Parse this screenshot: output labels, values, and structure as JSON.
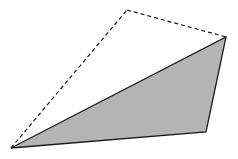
{
  "diagram": {
    "colors": {
      "background": "#ffffff",
      "fill": "#b4b4b4",
      "stroke": "#1a1a1a"
    },
    "vertices": {
      "left": [
        11,
        148
      ],
      "top": [
        127,
        10
      ],
      "right": [
        226,
        37
      ],
      "bottom_right": [
        206,
        132
      ]
    },
    "shaded_triangle": {
      "points": "11,148 226,37 206,132",
      "edge_style": "solid"
    },
    "dashed_edges": [
      {
        "from": "left",
        "to": "top",
        "points": [
          11,
          148,
          127,
          10
        ]
      },
      {
        "from": "top",
        "to": "right",
        "points": [
          127,
          10,
          226,
          37
        ]
      }
    ]
  }
}
